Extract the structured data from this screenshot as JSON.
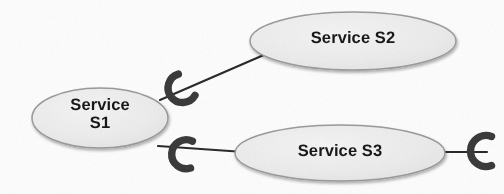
{
  "diagram": {
    "type": "uml-component-diagram",
    "background_color": "#fdfdfd",
    "node_fill_color": "#ededed",
    "node_stroke_color": "#9b9b9b",
    "connector_color": "#2b2b2b",
    "socket_color": "#3a3a3a",
    "text_color": "#18181a",
    "nodes": [
      {
        "id": "s1",
        "label": "Service\nS1",
        "shape": "ellipse",
        "cx": 100,
        "cy": 118,
        "rx": 68,
        "ry": 30
      },
      {
        "id": "s2",
        "label": "Service S2",
        "shape": "ellipse",
        "cx": 353,
        "cy": 41,
        "rx": 103,
        "ry": 29
      },
      {
        "id": "s3",
        "label": "Service S3",
        "shape": "ellipse",
        "cx": 340,
        "cy": 153,
        "rx": 105,
        "ry": 28
      }
    ],
    "connectors": [
      {
        "id": "c1",
        "from": "s1",
        "to": "s2",
        "orientation": "diagonal",
        "socket": "socket-s1-s2"
      },
      {
        "id": "c2",
        "from": "s1",
        "to": "s3",
        "orientation": "horizontal",
        "socket": "socket-s1-s3"
      },
      {
        "id": "c3",
        "from": "s3",
        "to": "open",
        "orientation": "horizontal",
        "socket": "socket-s3-open"
      }
    ],
    "sockets": [
      {
        "id": "socket-s1-s2",
        "x": 180,
        "y": 90,
        "rotation": -38,
        "opens": "upper-right"
      },
      {
        "id": "socket-s1-s3",
        "x": 183,
        "y": 154,
        "rotation": 4,
        "opens": "right"
      },
      {
        "id": "socket-s3-open",
        "x": 483,
        "y": 151,
        "rotation": 0,
        "opens": "right"
      }
    ]
  }
}
